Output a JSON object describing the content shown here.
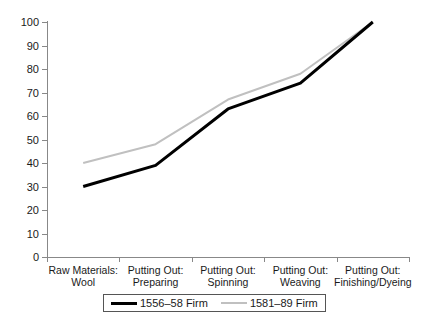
{
  "chart_data": {
    "type": "line",
    "title": "",
    "subtitle": "",
    "xlabel": "",
    "ylabel": "",
    "ylim": [
      0,
      100
    ],
    "ytick_step": 10,
    "yticks": [
      100,
      90,
      80,
      70,
      60,
      50,
      40,
      30,
      20,
      10,
      0
    ],
    "grid": false,
    "legend_position": "bottom",
    "categories": [
      "Raw Materials: Wool",
      "Putting Out: Preparing",
      "Putting Out: Spinning",
      "Putting Out: Weaving",
      "Putting Out: Finishing/Dyeing"
    ],
    "category_lines": [
      [
        "Raw Materials:",
        "Wool"
      ],
      [
        "Putting Out:",
        "Preparing"
      ],
      [
        "Putting Out:",
        "Spinning"
      ],
      [
        "Putting Out:",
        "Weaving"
      ],
      [
        "Putting Out:",
        "Finishing/Dyeing"
      ]
    ],
    "series": [
      {
        "name": "1556–58 Firm",
        "color": "#000000",
        "width": 3,
        "values": [
          30,
          39,
          63,
          74,
          100
        ]
      },
      {
        "name": "1581–89 Firm",
        "color": "#c0c0c0",
        "width": 2,
        "values": [
          40,
          48,
          67,
          78,
          100
        ]
      }
    ]
  },
  "legend": {
    "entries": [
      {
        "label": "1556–58 Firm"
      },
      {
        "label": "1581–89 Firm"
      }
    ]
  }
}
